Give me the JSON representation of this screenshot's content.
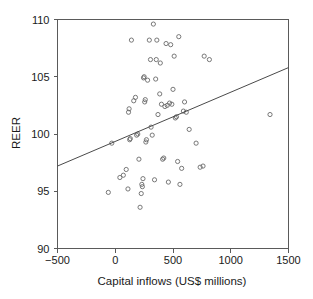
{
  "chart_data": {
    "type": "scatter",
    "title": "",
    "xlabel": "Capital inflows (US$ millions)",
    "ylabel": "REER",
    "xlim": [
      -500,
      1500
    ],
    "ylim": [
      90,
      110
    ],
    "xticks": [
      -500,
      0,
      500,
      1000,
      1500
    ],
    "xtick_labels": [
      "−500",
      "0",
      "500",
      "1000",
      "1500"
    ],
    "yticks": [
      90,
      95,
      100,
      105,
      110
    ],
    "ytick_labels": [
      "90",
      "95",
      "100",
      "105",
      "110"
    ],
    "grid": false,
    "legend": null,
    "marker": "open-circle",
    "marker_color": "#6a6a6a",
    "line_color": "#4a4a4a",
    "trendline": {
      "type": "linear-fit",
      "x": [
        -500,
        1500
      ],
      "y": [
        97.2,
        105.8
      ],
      "slope": 0.0043,
      "intercept": 99.35
    },
    "points": [
      {
        "x": -60,
        "y": 94.9
      },
      {
        "x": -30,
        "y": 99.2
      },
      {
        "x": 40,
        "y": 96.2
      },
      {
        "x": 70,
        "y": 96.4
      },
      {
        "x": 95,
        "y": 96.9
      },
      {
        "x": 110,
        "y": 95.2
      },
      {
        "x": 115,
        "y": 101.9
      },
      {
        "x": 120,
        "y": 102.2
      },
      {
        "x": 125,
        "y": 99.5
      },
      {
        "x": 130,
        "y": 99.6
      },
      {
        "x": 140,
        "y": 108.2
      },
      {
        "x": 160,
        "y": 102.9
      },
      {
        "x": 175,
        "y": 103.2
      },
      {
        "x": 185,
        "y": 99.9
      },
      {
        "x": 195,
        "y": 100.0
      },
      {
        "x": 205,
        "y": 97.8
      },
      {
        "x": 215,
        "y": 93.6
      },
      {
        "x": 225,
        "y": 94.8
      },
      {
        "x": 230,
        "y": 95.6
      },
      {
        "x": 235,
        "y": 95.4
      },
      {
        "x": 240,
        "y": 96.1
      },
      {
        "x": 245,
        "y": 104.9
      },
      {
        "x": 250,
        "y": 105.0
      },
      {
        "x": 255,
        "y": 102.8
      },
      {
        "x": 260,
        "y": 103.0
      },
      {
        "x": 265,
        "y": 99.3
      },
      {
        "x": 270,
        "y": 99.5
      },
      {
        "x": 280,
        "y": 104.7
      },
      {
        "x": 295,
        "y": 108.2
      },
      {
        "x": 305,
        "y": 106.5
      },
      {
        "x": 310,
        "y": 100.6
      },
      {
        "x": 320,
        "y": 99.9
      },
      {
        "x": 330,
        "y": 109.6
      },
      {
        "x": 340,
        "y": 96.0
      },
      {
        "x": 350,
        "y": 104.8
      },
      {
        "x": 355,
        "y": 106.5
      },
      {
        "x": 360,
        "y": 108.2
      },
      {
        "x": 370,
        "y": 101.7
      },
      {
        "x": 385,
        "y": 103.5
      },
      {
        "x": 390,
        "y": 106.2
      },
      {
        "x": 400,
        "y": 102.6
      },
      {
        "x": 410,
        "y": 97.8
      },
      {
        "x": 420,
        "y": 97.9
      },
      {
        "x": 430,
        "y": 102.4
      },
      {
        "x": 440,
        "y": 107.9
      },
      {
        "x": 450,
        "y": 102.5
      },
      {
        "x": 460,
        "y": 95.8
      },
      {
        "x": 470,
        "y": 102.7
      },
      {
        "x": 480,
        "y": 107.8
      },
      {
        "x": 490,
        "y": 102.6
      },
      {
        "x": 500,
        "y": 103.9
      },
      {
        "x": 510,
        "y": 106.8
      },
      {
        "x": 520,
        "y": 101.4
      },
      {
        "x": 530,
        "y": 101.5
      },
      {
        "x": 540,
        "y": 97.6
      },
      {
        "x": 550,
        "y": 108.5
      },
      {
        "x": 560,
        "y": 95.6
      },
      {
        "x": 575,
        "y": 97.0
      },
      {
        "x": 590,
        "y": 102.0
      },
      {
        "x": 600,
        "y": 102.8
      },
      {
        "x": 615,
        "y": 101.9
      },
      {
        "x": 640,
        "y": 100.4
      },
      {
        "x": 700,
        "y": 99.2
      },
      {
        "x": 735,
        "y": 97.1
      },
      {
        "x": 760,
        "y": 97.2
      },
      {
        "x": 770,
        "y": 106.8
      },
      {
        "x": 815,
        "y": 106.5
      },
      {
        "x": 1340,
        "y": 101.7
      }
    ]
  },
  "axes": {
    "x_axis_name": "x-axis",
    "y_axis_name": "y-axis"
  }
}
